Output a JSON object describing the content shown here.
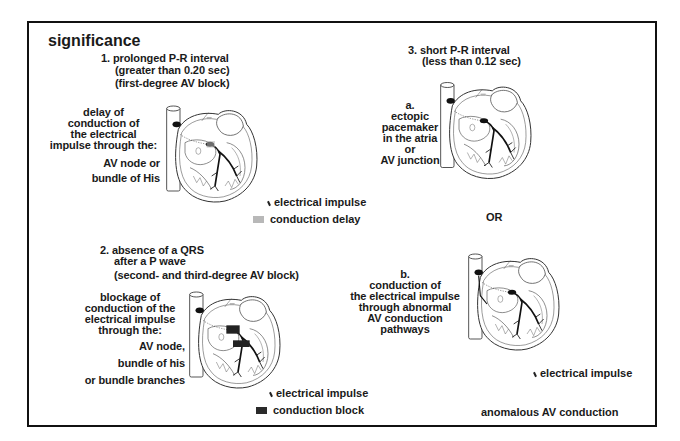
{
  "page": {
    "title": "significance"
  },
  "sections": {
    "s1": {
      "heading": [
        "1.  prolonged P-R interval",
        "(greater than 0.20 sec)",
        "(first-degree AV block)"
      ],
      "description": [
        "delay of",
        "conduction of",
        "the electrical",
        "impulse through the:"
      ],
      "sites": [
        "AV node  or",
        "bundle of His"
      ],
      "legend": {
        "impulse_label": "electrical impulse",
        "marker_label": "conduction delay",
        "marker_color": "#b8b8b8"
      }
    },
    "s2": {
      "heading": [
        "2.  absence of a QRS",
        "after a P wave",
        "(second- and third-degree AV block)"
      ],
      "description": [
        "blockage of",
        "conduction of the",
        "electrical impulse",
        "through the:"
      ],
      "sites": [
        "AV node,",
        "bundle of his",
        "or bundle branches"
      ],
      "legend": {
        "impulse_label": "electrical impulse",
        "marker_label": "conduction block",
        "marker_color": "#2a2a2a"
      }
    },
    "s3": {
      "heading": [
        "3.  short P-R interval",
        "(less than 0.12 sec)"
      ],
      "option_a": [
        "a.",
        "ectopic",
        "pacemaker",
        "in the atria",
        "or",
        "AV junction"
      ],
      "separator": "OR",
      "option_b": [
        "b.",
        "conduction of",
        "the electrical impulse",
        "through abnormal",
        "AV conduction",
        "pathways"
      ],
      "legend": {
        "impulse_label": "electrical impulse",
        "caption": "anomalous AV conduction"
      }
    }
  },
  "icons": {
    "impulse_marker": "small-slash-tick",
    "heart": "heart-cross-section-illustration"
  },
  "colors": {
    "border": "#111111",
    "text": "#1a1a1a",
    "background": "#ffffff"
  }
}
